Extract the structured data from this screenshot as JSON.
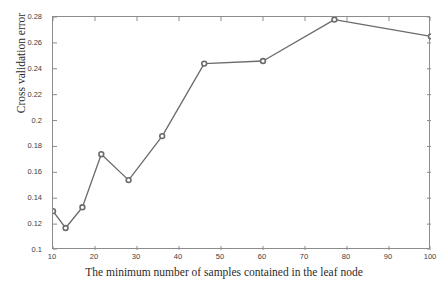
{
  "chart_data": {
    "type": "line",
    "title": "",
    "xlabel": "The minimum number of samples contained in the leaf node",
    "ylabel": "Cross validation error",
    "xlim": [
      10,
      100
    ],
    "ylim": [
      0.1,
      0.28
    ],
    "grid": false,
    "legend": null,
    "xticks": [
      "10",
      "20",
      "30",
      "40",
      "50",
      "60",
      "70",
      "80",
      "90",
      "100"
    ],
    "xtick_values": [
      10,
      20,
      30,
      40,
      50,
      60,
      70,
      80,
      90,
      100
    ],
    "yticks": [
      "0.28",
      "0.26",
      "0.24",
      "0.22",
      "0.2",
      "0.18",
      "0.16",
      "0.14",
      "0.12",
      "0.1"
    ],
    "ytick_values": [
      0.28,
      0.26,
      0.24,
      0.22,
      0.2,
      0.18,
      0.16,
      0.14,
      0.12,
      0.1
    ],
    "x": [
      10,
      13,
      17,
      21.5,
      28,
      36,
      46,
      60,
      77,
      100
    ],
    "y": [
      0.13,
      0.117,
      0.133,
      0.174,
      0.154,
      0.188,
      0.244,
      0.246,
      0.278,
      0.265
    ],
    "series": [
      {
        "name": "Cross validation error",
        "x": [
          10,
          13,
          17,
          21.5,
          28,
          36,
          46,
          60,
          77,
          100
        ],
        "values": [
          0.13,
          0.117,
          0.133,
          0.174,
          0.154,
          0.188,
          0.244,
          0.246,
          0.278,
          0.265
        ]
      }
    ],
    "line_color": "#6b6b6b",
    "marker_color": "#6b6b6b",
    "marker": "circle",
    "axis_color": "#8c8c8c",
    "background_color": "#ffffff"
  }
}
